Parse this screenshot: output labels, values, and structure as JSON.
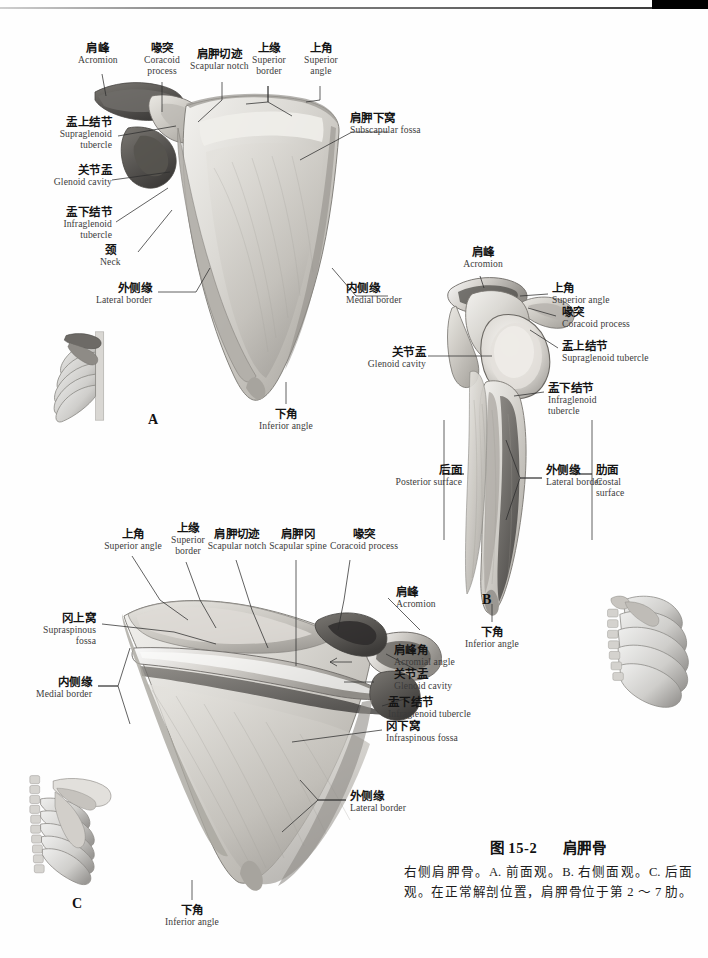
{
  "figure": {
    "number": "图 15-2",
    "title": "肩胛骨",
    "caption": "右侧肩胛骨。A. 前面观。B. 右侧面观。C. 后面观。在正常解剖位置，肩胛骨位于第 2 ～ 7 肋。"
  },
  "panels": {
    "a": {
      "letter": "A",
      "view": "前面观 / Anterior view"
    },
    "b": {
      "letter": "B",
      "view": "右侧面观 / Right lateral view"
    },
    "c": {
      "letter": "C",
      "view": "后面观 / Posterior view"
    }
  },
  "labels_a": [
    {
      "cn": "肩峰",
      "en": "Acromion"
    },
    {
      "cn": "喙突",
      "en": "Coracoid\nprocess"
    },
    {
      "cn": "肩胛切迹",
      "en": "Scapular notch"
    },
    {
      "cn": "上缘",
      "en": "Superior\nborder"
    },
    {
      "cn": "上角",
      "en": "Superior\nangle"
    },
    {
      "cn": "肩胛下窝",
      "en": "Subscapular fossa"
    },
    {
      "cn": "盂上结节",
      "en": "Supraglenoid\ntubercle"
    },
    {
      "cn": "关节盂",
      "en": "Glenoid cavity"
    },
    {
      "cn": "盂下结节",
      "en": "Infraglenoid\ntubercle"
    },
    {
      "cn": "颈",
      "en": "Neck"
    },
    {
      "cn": "外侧缘",
      "en": "Lateral border"
    },
    {
      "cn": "内侧缘",
      "en": "Medial border"
    },
    {
      "cn": "下角",
      "en": "Inferior angle"
    }
  ],
  "labels_b": [
    {
      "cn": "肩峰",
      "en": "Acromion"
    },
    {
      "cn": "上角",
      "en": "Superior angle"
    },
    {
      "cn": "喙突",
      "en": "Coracoid process"
    },
    {
      "cn": "盂上结节",
      "en": "Supraglenoid tubercle"
    },
    {
      "cn": "关节盂",
      "en": "Glenoid cavity"
    },
    {
      "cn": "盂下结节",
      "en": "Infraglenoid\ntubercle"
    },
    {
      "cn": "后面",
      "en": "Posterior surface"
    },
    {
      "cn": "外侧缘",
      "en": "Lateral border"
    },
    {
      "cn": "肋面",
      "en": "Costal\nsurface"
    },
    {
      "cn": "下角",
      "en": "Inferior angle"
    }
  ],
  "labels_c": [
    {
      "cn": "上角",
      "en": "Superior angle"
    },
    {
      "cn": "上缘",
      "en": "Superior\nborder"
    },
    {
      "cn": "肩胛切迹",
      "en": "Scapular notch"
    },
    {
      "cn": "肩胛冈",
      "en": "Scapular spine"
    },
    {
      "cn": "喙突",
      "en": "Coracoid process"
    },
    {
      "cn": "肩峰",
      "en": "Acromion"
    },
    {
      "cn": "冈上窝",
      "en": "Supraspinous\nfossa"
    },
    {
      "cn": "肩峰角",
      "en": "Acromial angle"
    },
    {
      "cn": "关节盂",
      "en": "Glenoid cavity"
    },
    {
      "cn": "盂下结节",
      "en": "Infraglenoid tubercle"
    },
    {
      "cn": "内侧缘",
      "en": "Medial border"
    },
    {
      "cn": "冈下窝",
      "en": "Infraspinous fossa"
    },
    {
      "cn": "外侧缘",
      "en": "Lateral border"
    },
    {
      "cn": "下角",
      "en": "Inferior angle"
    }
  ],
  "insets": [
    {
      "name": "thorax-inset-a",
      "panel": "A"
    },
    {
      "name": "thorax-inset-b",
      "panel": "B"
    },
    {
      "name": "thorax-inset-c",
      "panel": "C"
    }
  ],
  "colors": {
    "bone_light": "#e9e7e2",
    "bone_mid": "#c9c6c0",
    "bone_dark": "#8d8a85",
    "bone_shadow": "#5c5a57",
    "leader": "#2e2e2e",
    "text": "#141414",
    "text_en": "#3b3b3b",
    "edge_tab": "#000000"
  }
}
